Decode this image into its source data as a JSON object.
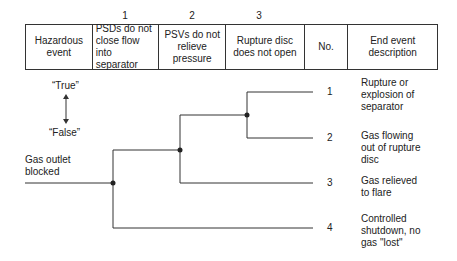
{
  "header": {
    "column_numbers": [
      "1",
      "2",
      "3"
    ],
    "columns": [
      {
        "label": "Hazardous event"
      },
      {
        "label": "PSDs do not close flow into separator"
      },
      {
        "label": "PSVs do not relieve pressure"
      },
      {
        "label": "Rupture disc does not open"
      },
      {
        "label": "No."
      },
      {
        "label": "End event description"
      }
    ]
  },
  "legend": {
    "true_label": "“True”",
    "false_label": "“False”"
  },
  "initiating_event": "Gas outlet blocked",
  "outcomes": [
    {
      "no": "1",
      "description": "Rupture or explosion of separator"
    },
    {
      "no": "2",
      "description": "Gas flowing out of rupture disc"
    },
    {
      "no": "3",
      "description": "Gas relieved to flare"
    },
    {
      "no": "4",
      "description": "Controlled shutdown, no gas \"lost\""
    }
  ],
  "colors": {
    "line": "#333333",
    "background": "#ffffff"
  }
}
